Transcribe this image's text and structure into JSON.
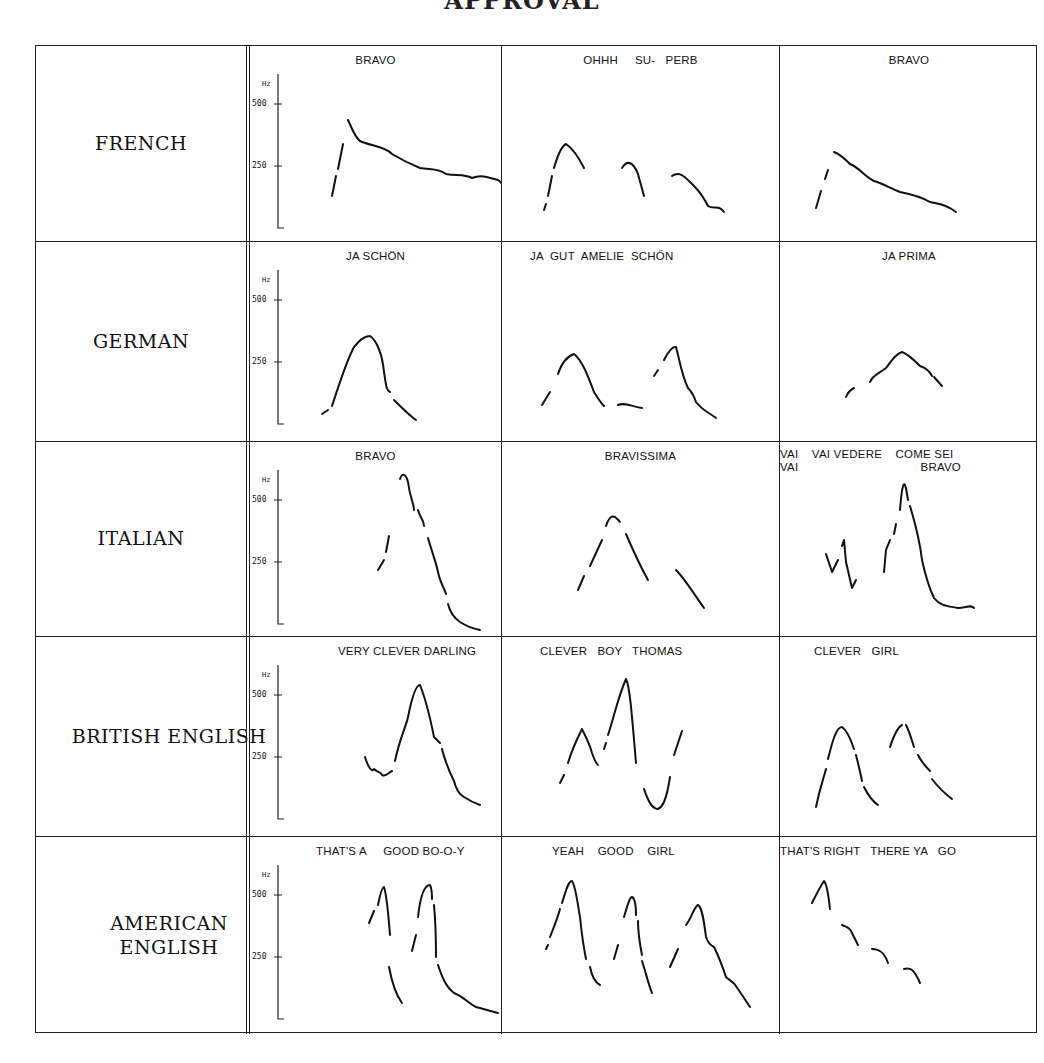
{
  "title": "APPROVAL",
  "chart_data": {
    "type": "line",
    "title": "APPROVAL",
    "ylabel": "Hz",
    "yticks": [
      250,
      500
    ],
    "ylim": [
      0,
      650
    ],
    "grid": false,
    "rows": [
      {
        "language": "FRENCH",
        "examples": [
          {
            "phrase": "BRAVO",
            "peak_hz": 450,
            "shape": "rise then long falling declination"
          },
          {
            "phrase": "OHHH     SU-   PERB",
            "peak_hz": 360,
            "shape": "three falling segments"
          },
          {
            "phrase": "BRAVO",
            "peak_hz": 350,
            "shape": "rise then long falling declination"
          }
        ]
      },
      {
        "language": "GERMAN",
        "examples": [
          {
            "phrase": "JA SCHÖN",
            "peak_hz": 420,
            "shape": "single bell peak"
          },
          {
            "phrase": "JA  GUT  AMELIE  SCHŐN",
            "peak_hz": 340,
            "shape": "two peaks with low plateau"
          },
          {
            "phrase": "JA PRIMA",
            "peak_hz": 320,
            "shape": "gentle rise-fall"
          }
        ]
      },
      {
        "language": "ITALIAN",
        "examples": [
          {
            "phrase": "BRAVO",
            "peak_hz": 630,
            "shape": "steep rise-fall"
          },
          {
            "phrase": "BRAVISSIMA",
            "peak_hz": 430,
            "shape": "rise-fall plus falling tail"
          },
          {
            "phrase": "VAI    VAI VEDERE    COME SEI\nVAI                                    BRAVO",
            "peak_hz": 570,
            "shape": "small dips then sharp peak and long tail"
          }
        ]
      },
      {
        "language": "BRITISH ENGLISH",
        "examples": [
          {
            "phrase": "VERY CLEVER DARLING",
            "peak_hz": 560,
            "shape": "low wiggle then sharp peak"
          },
          {
            "phrase": "CLEVER   BOY   THOMAS",
            "peak_hz": 580,
            "shape": "two peaks, deep trough, rise"
          },
          {
            "phrase": "CLEVER   GIRL",
            "peak_hz": 380,
            "shape": "two bell peaks"
          }
        ]
      },
      {
        "language": "AMERICAN ENGLISH",
        "examples": [
          {
            "phrase": "THAT'S A     GOOD BO-O-Y",
            "peak_hz": 550,
            "shape": "two sharp peaks with long tail"
          },
          {
            "phrase": "YEAH    GOOD    GIRL",
            "peak_hz": 540,
            "shape": "three sharp peaks"
          },
          {
            "phrase": "THAT'S RIGHT   THERE YA   GO",
            "peak_hz": 520,
            "shape": "peak then stepwise falling segments"
          }
        ]
      }
    ]
  },
  "axis": {
    "unit": "Hz",
    "tick_high": "500",
    "tick_low": "250"
  }
}
